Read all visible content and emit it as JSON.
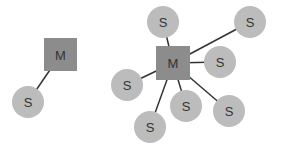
{
  "colors": {
    "background": "#ffffff",
    "master_fill": "#8c8c8c",
    "slave_fill": "#bcbcbc",
    "edge": "#333333",
    "label": "#333333"
  },
  "diagrams": [
    {
      "name": "single-slave",
      "master": {
        "label": "M",
        "x": 44,
        "y": 38,
        "size": 33
      },
      "slaves": [
        {
          "label": "S",
          "cx": 28,
          "cy": 102,
          "r": 16
        }
      ]
    },
    {
      "name": "multi-slave",
      "master": {
        "label": "M",
        "x": 156,
        "y": 46,
        "size": 34
      },
      "slaves": [
        {
          "label": "S",
          "cx": 163,
          "cy": 22,
          "r": 16
        },
        {
          "label": "S",
          "cx": 250,
          "cy": 22,
          "r": 16
        },
        {
          "label": "S",
          "cx": 220,
          "cy": 62,
          "r": 16
        },
        {
          "label": "S",
          "cx": 127,
          "cy": 85,
          "r": 16
        },
        {
          "label": "S",
          "cx": 150,
          "cy": 127,
          "r": 16
        },
        {
          "label": "S",
          "cx": 186,
          "cy": 106,
          "r": 16
        },
        {
          "label": "S",
          "cx": 229,
          "cy": 111,
          "r": 16
        }
      ]
    }
  ]
}
